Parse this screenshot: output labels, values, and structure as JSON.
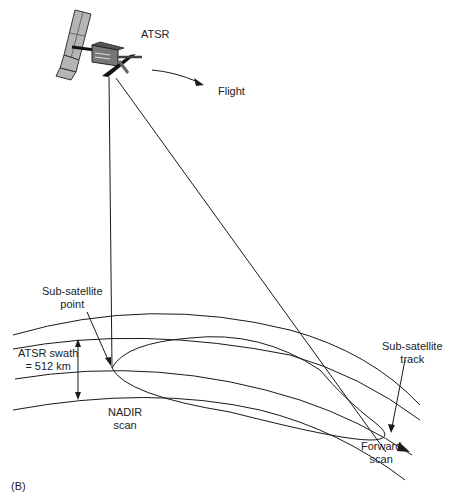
{
  "panel_label": "(B)",
  "labels": {
    "instrument": "ATSR",
    "flight": "Flight",
    "sub_satellite_point_line1": "Sub-satellite",
    "sub_satellite_point_line2": "point",
    "swath_line1": "ATSR swath",
    "swath_line2": "= 512 km",
    "nadir_line1": "NADIR",
    "nadir_line2": "scan",
    "track_line1": "Sub-satellite",
    "track_line2": "track",
    "forward_line1": "Forward",
    "forward_line2": "scan"
  },
  "colors": {
    "line": "#1a1a1a",
    "panel": "#9a9a9a",
    "body": "#6e6e6e"
  }
}
